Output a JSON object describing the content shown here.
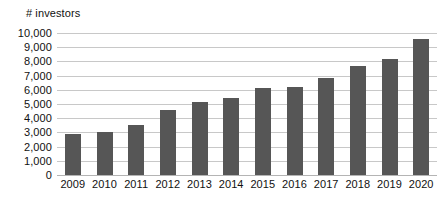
{
  "chart_data": {
    "type": "bar",
    "title": "",
    "ylabel": "# investors",
    "xlabel": "",
    "categories": [
      "2009",
      "2010",
      "2011",
      "2012",
      "2013",
      "2014",
      "2015",
      "2016",
      "2017",
      "2018",
      "2019",
      "2020"
    ],
    "values": [
      2900,
      3050,
      3550,
      4600,
      5150,
      5450,
      6100,
      6200,
      6850,
      7650,
      8200,
      9600
    ],
    "ylim": [
      0,
      10000
    ],
    "y_ticks": [
      0,
      1000,
      2000,
      3000,
      4000,
      5000,
      6000,
      7000,
      8000,
      9000,
      10000
    ],
    "y_tick_labels": [
      "0",
      "1,000",
      "2,000",
      "3,000",
      "4,000",
      "5,000",
      "6,000",
      "7,000",
      "8,000",
      "9,000",
      "10,000"
    ],
    "grid": true,
    "grid_axis": "y",
    "legend": false,
    "legend_position": "none",
    "series": [
      {
        "name": "# investors",
        "color": "#565656",
        "values": [
          2900,
          3050,
          3550,
          4600,
          5150,
          5450,
          6100,
          6200,
          6850,
          7650,
          8200,
          9600
        ]
      }
    ]
  },
  "colors": {
    "bar": "#565656",
    "gridline": "#c8c8c8",
    "baseline": "#b4b4b4",
    "background": "#ffffff",
    "text": "#111111"
  }
}
